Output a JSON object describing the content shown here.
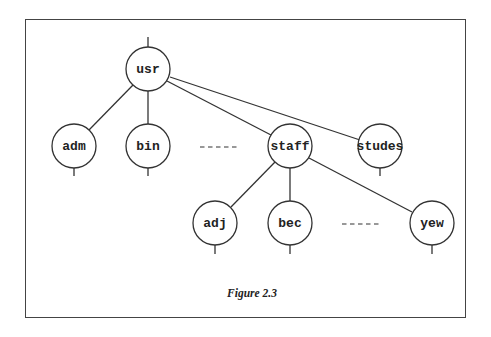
{
  "figure": {
    "caption": "Figure 2.3",
    "nodes": {
      "usr": "usr",
      "adm": "adm",
      "bin": "bin",
      "staff": "staff",
      "studes": "studes",
      "adj": "adj",
      "bec": "bec",
      "yew": "yew"
    },
    "ellipsis_level1": "- - - - -",
    "ellipsis_level2": "- - - - -"
  }
}
